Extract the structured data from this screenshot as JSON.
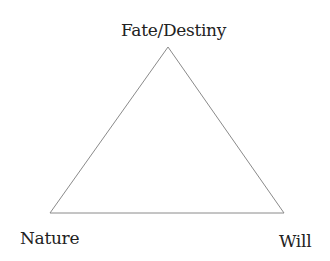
{
  "diagram": {
    "type": "triangle",
    "vertices": {
      "top": {
        "label": "Fate/Destiny",
        "x": 168,
        "y": 47
      },
      "bottom_left": {
        "label": "Nature",
        "x": 50,
        "y": 213
      },
      "bottom_right": {
        "label": "Will",
        "x": 284,
        "y": 213
      }
    },
    "line_color": "#8a8a8a",
    "text_color": "#222222",
    "background": "#ffffff"
  }
}
